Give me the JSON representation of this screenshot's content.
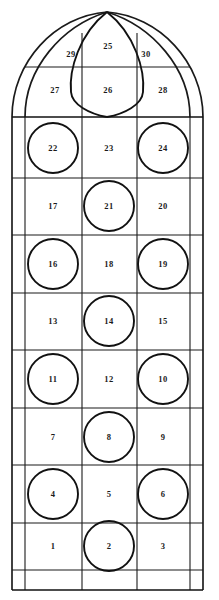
{
  "diagram": {
    "type": "architectural-panel-schematic",
    "stroke_color": "#111111",
    "background_color": "#ffffff",
    "canvas": {
      "width": 219,
      "height": 600
    }
  },
  "geometry": {
    "apex": {
      "x": 107,
      "y": 12
    },
    "outer_border": {
      "left": 12,
      "right": 203,
      "bottom": 590
    },
    "inner_border": {
      "left": 25,
      "right": 190
    },
    "column_dividers": [
      82,
      137
    ],
    "row_lines": [
      67,
      117,
      178,
      235,
      293,
      350,
      408,
      465,
      523,
      570,
      590
    ],
    "springline_y": 117,
    "vesica": {
      "top_y": 12,
      "bottom_y": 117,
      "half_width": 38
    }
  },
  "panels": [
    {
      "id": "panel-1",
      "label": "1",
      "x": 53,
      "y": 546,
      "shape": "rect",
      "column": "left",
      "row": 1
    },
    {
      "id": "panel-2",
      "label": "2",
      "x": 109,
      "y": 546,
      "shape": "circle",
      "column": "center",
      "row": 1
    },
    {
      "id": "panel-3",
      "label": "3",
      "x": 163,
      "y": 546,
      "shape": "rect",
      "column": "right",
      "row": 1
    },
    {
      "id": "panel-4",
      "label": "4",
      "x": 53,
      "y": 494,
      "shape": "circle",
      "column": "left",
      "row": 2
    },
    {
      "id": "panel-5",
      "label": "5",
      "x": 109,
      "y": 494,
      "shape": "rect",
      "column": "center",
      "row": 2
    },
    {
      "id": "panel-6",
      "label": "6",
      "x": 163,
      "y": 494,
      "shape": "circle",
      "column": "right",
      "row": 2
    },
    {
      "id": "panel-7",
      "label": "7",
      "x": 53,
      "y": 437,
      "shape": "rect",
      "column": "left",
      "row": 3
    },
    {
      "id": "panel-8",
      "label": "8",
      "x": 109,
      "y": 437,
      "shape": "circle",
      "column": "center",
      "row": 3
    },
    {
      "id": "panel-9",
      "label": "9",
      "x": 163,
      "y": 437,
      "shape": "rect",
      "column": "right",
      "row": 3
    },
    {
      "id": "panel-10",
      "label": "10",
      "x": 163,
      "y": 379,
      "shape": "circle",
      "column": "right",
      "row": 4
    },
    {
      "id": "panel-11",
      "label": "11",
      "x": 53,
      "y": 379,
      "shape": "circle",
      "column": "left",
      "row": 4
    },
    {
      "id": "panel-12",
      "label": "12",
      "x": 109,
      "y": 379,
      "shape": "rect",
      "column": "center",
      "row": 4
    },
    {
      "id": "panel-13",
      "label": "13",
      "x": 53,
      "y": 321,
      "shape": "rect",
      "column": "left",
      "row": 5
    },
    {
      "id": "panel-14",
      "label": "14",
      "x": 109,
      "y": 321,
      "shape": "circle",
      "column": "center",
      "row": 5
    },
    {
      "id": "panel-15",
      "label": "15",
      "x": 163,
      "y": 321,
      "shape": "rect",
      "column": "right",
      "row": 5
    },
    {
      "id": "panel-16",
      "label": "16",
      "x": 53,
      "y": 264,
      "shape": "circle",
      "column": "left",
      "row": 6
    },
    {
      "id": "panel-17",
      "label": "17",
      "x": 53,
      "y": 206,
      "shape": "rect",
      "column": "left",
      "row": 7
    },
    {
      "id": "panel-18",
      "label": "18",
      "x": 109,
      "y": 264,
      "shape": "rect",
      "column": "center",
      "row": 6
    },
    {
      "id": "panel-19",
      "label": "19",
      "x": 163,
      "y": 264,
      "shape": "circle",
      "column": "right",
      "row": 6
    },
    {
      "id": "panel-20",
      "label": "20",
      "x": 163,
      "y": 206,
      "shape": "rect",
      "column": "right",
      "row": 7
    },
    {
      "id": "panel-21",
      "label": "21",
      "x": 109,
      "y": 206,
      "shape": "circle",
      "column": "center",
      "row": 7
    },
    {
      "id": "panel-22",
      "label": "22",
      "x": 53,
      "y": 148,
      "shape": "circle",
      "column": "left",
      "row": 8
    },
    {
      "id": "panel-23",
      "label": "23",
      "x": 109,
      "y": 148,
      "shape": "rect",
      "column": "center",
      "row": 8
    },
    {
      "id": "panel-24",
      "label": "24",
      "x": 163,
      "y": 148,
      "shape": "circle",
      "column": "right",
      "row": 8
    },
    {
      "id": "panel-25",
      "label": "25",
      "x": 108,
      "y": 46,
      "shape": "vesica-upper",
      "column": "center",
      "row": "tracery"
    },
    {
      "id": "panel-26",
      "label": "26",
      "x": 108,
      "y": 90,
      "shape": "vesica-lower",
      "column": "center",
      "row": "tracery"
    },
    {
      "id": "panel-27",
      "label": "27",
      "x": 55,
      "y": 90,
      "shape": "arch-left",
      "column": "left",
      "row": "tracery"
    },
    {
      "id": "panel-28",
      "label": "28",
      "x": 163,
      "y": 90,
      "shape": "arch-right",
      "column": "right",
      "row": "tracery"
    },
    {
      "id": "panel-29",
      "label": "29",
      "x": 71,
      "y": 54,
      "shape": "spandrel-left",
      "column": "left",
      "row": "tracery"
    },
    {
      "id": "panel-30",
      "label": "30",
      "x": 146,
      "y": 54,
      "shape": "spandrel-right",
      "column": "right",
      "row": "tracery"
    }
  ],
  "medallions": [
    {
      "cx": 53,
      "cy": 148,
      "r": 25,
      "panel": "22"
    },
    {
      "cx": 163,
      "cy": 148,
      "r": 25,
      "panel": "24"
    },
    {
      "cx": 109,
      "cy": 206,
      "r": 25,
      "panel": "21"
    },
    {
      "cx": 53,
      "cy": 264,
      "r": 25,
      "panel": "16"
    },
    {
      "cx": 163,
      "cy": 264,
      "r": 25,
      "panel": "19"
    },
    {
      "cx": 109,
      "cy": 321,
      "r": 25,
      "panel": "14"
    },
    {
      "cx": 53,
      "cy": 379,
      "r": 25,
      "panel": "11"
    },
    {
      "cx": 163,
      "cy": 379,
      "r": 25,
      "panel": "10"
    },
    {
      "cx": 109,
      "cy": 437,
      "r": 25,
      "panel": "8"
    },
    {
      "cx": 53,
      "cy": 494,
      "r": 25,
      "panel": "4"
    },
    {
      "cx": 163,
      "cy": 494,
      "r": 25,
      "panel": "6"
    },
    {
      "cx": 109,
      "cy": 546,
      "r": 25,
      "panel": "2"
    }
  ]
}
